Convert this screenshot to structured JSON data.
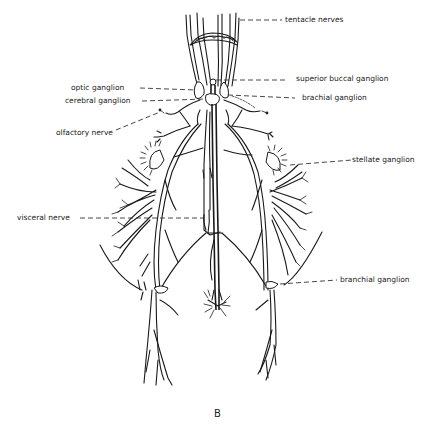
{
  "figure": {
    "caption": "B",
    "labels": {
      "tentacle_nerves": "tentacle nerves",
      "optic_ganglion": "optic ganglion",
      "cerebral_ganglion": "cerebral ganglion",
      "olfactory_nerve": "olfactory nerve",
      "superior_buccal_ganglion": "superior buccal ganglion",
      "brachial_ganglion": "brachial ganglion",
      "stellate_ganglion": "stellate ganglion",
      "visceral_nerve": "visceral nerve",
      "branchial_ganglion": "branchial ganglion"
    }
  }
}
